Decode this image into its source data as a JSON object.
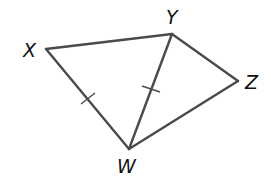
{
  "diagram": {
    "type": "geometry",
    "vertices": {
      "X": {
        "label": "X",
        "x": 46,
        "y": 49
      },
      "Y": {
        "label": "Y",
        "x": 172,
        "y": 34
      },
      "Z": {
        "label": "Z",
        "x": 238,
        "y": 81
      },
      "W": {
        "label": "W",
        "x": 129,
        "y": 149
      }
    },
    "segments": [
      "XY",
      "YZ",
      "ZW",
      "WX",
      "YW"
    ],
    "congruent_marks": [
      "XW",
      "YW"
    ],
    "colors": {
      "stroke": "#4a4a4a",
      "text": "#111111"
    }
  }
}
